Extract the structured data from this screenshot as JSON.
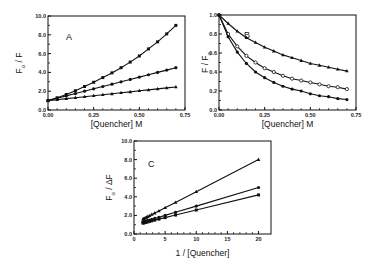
{
  "chart_data": [
    {
      "id": "A",
      "type": "line",
      "panel_label": "A",
      "xlabel": "[Quencher]  M",
      "ylabel_main": "F",
      "ylabel_sub": "o",
      "ylabel_tail": " / F",
      "xlim": [
        0,
        0.75
      ],
      "ylim": [
        0,
        10
      ],
      "xticks": [
        0,
        0.25,
        0.5,
        0.75
      ],
      "xtick_labels": [
        "0.00",
        "0.25",
        "0.50",
        "0.75"
      ],
      "yticks": [
        0,
        2,
        4,
        6,
        8,
        10
      ],
      "ytick_labels": [
        "0.0",
        "2.0",
        "4.0",
        "6.0",
        "8.0",
        "10.0"
      ],
      "x": [
        0,
        0.05,
        0.1,
        0.15,
        0.2,
        0.25,
        0.3,
        0.35,
        0.4,
        0.45,
        0.5,
        0.55,
        0.6,
        0.65,
        0.7
      ],
      "series": [
        {
          "name": "filled squares",
          "marker": "square",
          "values": [
            1.0,
            1.3,
            1.65,
            2.05,
            2.5,
            2.95,
            3.45,
            3.95,
            4.5,
            5.1,
            5.75,
            6.5,
            7.25,
            8.1,
            9.0
          ]
        },
        {
          "name": "filled circles",
          "marker": "circle",
          "values": [
            1.0,
            1.25,
            1.5,
            1.75,
            2.0,
            2.25,
            2.5,
            2.75,
            3.0,
            3.25,
            3.5,
            3.75,
            4.0,
            4.25,
            4.5
          ]
        },
        {
          "name": "filled triangles",
          "marker": "triangle",
          "values": [
            1.0,
            1.1,
            1.21,
            1.31,
            1.41,
            1.52,
            1.62,
            1.72,
            1.83,
            1.93,
            2.04,
            2.14,
            2.24,
            2.35,
            2.45
          ]
        }
      ]
    },
    {
      "id": "B",
      "type": "line",
      "panel_label": "B",
      "xlabel": "[Quencher]  M",
      "ylabel_main": "F / F",
      "ylabel_sub": "o",
      "ylabel_tail": "",
      "xlim": [
        0,
        0.75
      ],
      "ylim": [
        0,
        1.0
      ],
      "xticks": [
        0,
        0.25,
        0.5,
        0.75
      ],
      "xtick_labels": [
        "0.00",
        "0.25",
        "0.50",
        "0.75"
      ],
      "yticks": [
        0,
        0.2,
        0.4,
        0.6,
        0.8,
        1.0
      ],
      "ytick_labels": [
        "0.0",
        "0.2",
        "0.4",
        "0.6",
        "0.8",
        "1.0"
      ],
      "x": [
        0,
        0.05,
        0.1,
        0.15,
        0.2,
        0.25,
        0.3,
        0.35,
        0.4,
        0.45,
        0.5,
        0.55,
        0.6,
        0.65,
        0.7
      ],
      "series": [
        {
          "name": "triangles",
          "marker": "triangle",
          "values": [
            1.0,
            0.91,
            0.83,
            0.76,
            0.71,
            0.66,
            0.62,
            0.58,
            0.55,
            0.52,
            0.49,
            0.47,
            0.45,
            0.43,
            0.41
          ]
        },
        {
          "name": "open circles",
          "marker": "open-circle",
          "values": [
            1.0,
            0.8,
            0.67,
            0.57,
            0.5,
            0.44,
            0.4,
            0.36,
            0.33,
            0.31,
            0.29,
            0.27,
            0.25,
            0.24,
            0.22
          ]
        },
        {
          "name": "filled circles",
          "marker": "circle",
          "values": [
            1.0,
            0.77,
            0.61,
            0.49,
            0.4,
            0.34,
            0.29,
            0.25,
            0.22,
            0.2,
            0.17,
            0.15,
            0.14,
            0.12,
            0.11
          ]
        }
      ]
    },
    {
      "id": "C",
      "type": "line",
      "panel_label": "C",
      "xlabel": "1 / [Quencher]",
      "ylabel_main": "F",
      "ylabel_sub": "o",
      "ylabel_tail": " / ΔF",
      "xlim": [
        0,
        22
      ],
      "ylim": [
        0,
        10
      ],
      "xticks": [
        0,
        5,
        10,
        15,
        20
      ],
      "xtick_labels": [
        "0",
        "5",
        "10",
        "15",
        "20"
      ],
      "yticks": [
        0,
        2,
        4,
        6,
        8,
        10
      ],
      "ytick_labels": [
        "0.0",
        "2.0",
        "4.0",
        "6.0",
        "8.0",
        "10.0"
      ],
      "x": [
        1.43,
        1.54,
        1.67,
        1.82,
        2.0,
        2.22,
        2.5,
        2.86,
        3.33,
        4.0,
        5.0,
        6.67,
        10.0,
        20.0
      ],
      "series": [
        {
          "name": "triangles",
          "marker": "triangle",
          "values": [
            1.59,
            1.63,
            1.68,
            1.73,
            1.79,
            1.87,
            1.96,
            2.09,
            2.25,
            2.48,
            2.83,
            3.4,
            4.55,
            8.0
          ]
        },
        {
          "name": "filled circles",
          "marker": "circle",
          "values": [
            1.29,
            1.31,
            1.33,
            1.36,
            1.4,
            1.44,
            1.5,
            1.57,
            1.67,
            1.8,
            2.0,
            2.33,
            3.0,
            5.0
          ]
        },
        {
          "name": "filled squares",
          "marker": "square",
          "values": [
            1.18,
            1.2,
            1.22,
            1.25,
            1.28,
            1.31,
            1.36,
            1.42,
            1.49,
            1.6,
            1.76,
            2.04,
            2.58,
            4.2
          ]
        }
      ]
    }
  ]
}
